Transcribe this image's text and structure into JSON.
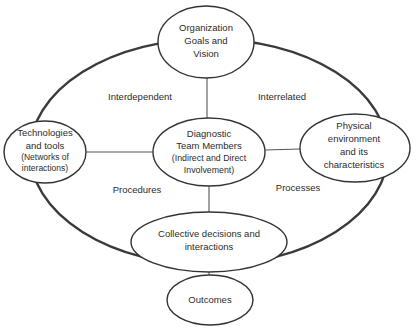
{
  "diagram": {
    "type": "conceptual-framework",
    "nodes": {
      "top": {
        "id": "organization-goals",
        "lines": [
          "Organization",
          "Goals and",
          "Vision"
        ]
      },
      "left": {
        "id": "technologies-tools",
        "lines": [
          "Technologies",
          "and tools",
          "(Networks of",
          "interactions)"
        ]
      },
      "center": {
        "id": "diagnostic-team",
        "lines": [
          "Diagnostic",
          "Team Members",
          "(Indirect and Direct",
          "Involvement)"
        ]
      },
      "right": {
        "id": "physical-environment",
        "lines": [
          "Physical",
          "environment",
          "and its",
          "characteristics"
        ]
      },
      "bottom": {
        "id": "collective-decisions",
        "lines": [
          "Collective decisions and",
          "interactions"
        ]
      },
      "outcome": {
        "id": "outcomes",
        "lines": [
          "Outcomes"
        ]
      }
    },
    "quadrant_labels": {
      "top_left": "Interdependent",
      "top_right": "Interrelated",
      "bottom_left": "Procedures",
      "bottom_right": "Processes"
    },
    "edges": [
      {
        "from": "diagnostic-team",
        "to": "organization-goals"
      },
      {
        "from": "diagnostic-team",
        "to": "technologies-tools"
      },
      {
        "from": "diagnostic-team",
        "to": "physical-environment"
      },
      {
        "from": "diagnostic-team",
        "to": "collective-decisions"
      },
      {
        "from": "collective-decisions",
        "to": "outcomes"
      }
    ],
    "colors": {
      "stroke": "#333333",
      "text": "#2b2b2b",
      "background": "#ffffff"
    }
  }
}
